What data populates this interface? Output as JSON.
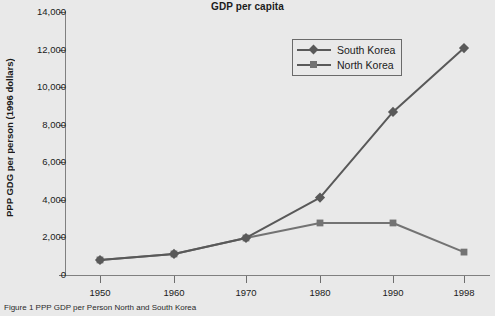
{
  "chart_data": {
    "type": "line",
    "title": "GDP per capita",
    "xlabel": "",
    "ylabel": "PPP GDG per person (1996 dollars)",
    "x": [
      "1950",
      "1960",
      "1970",
      "1980",
      "1990",
      "1998"
    ],
    "xtick_labels": [
      "1950",
      "1960",
      "1970",
      "1980",
      "1990",
      "1998"
    ],
    "ytick_labels": [
      "0",
      "2,000",
      "4,000",
      "6,000",
      "8,000",
      "10,000",
      "12,000",
      "14,000"
    ],
    "ytick_values": [
      0,
      2000,
      4000,
      6000,
      8000,
      10000,
      12000,
      14000
    ],
    "ylim": [
      0,
      14000
    ],
    "grid": false,
    "legend_position": "top-right",
    "series": [
      {
        "name": "South Korea",
        "marker": "diamond",
        "color": "#595959",
        "values": [
          800,
          1120,
          1970,
          4120,
          8680,
          12080
        ]
      },
      {
        "name": "North Korea",
        "marker": "square",
        "color": "#737373",
        "values": [
          800,
          1120,
          1970,
          2770,
          2770,
          1220
        ]
      }
    ]
  },
  "caption": {
    "text": "Figure 1   PPP GDP per Person North and South Korea"
  },
  "colors": {
    "background": "#e9e9e9",
    "axis": "#808080",
    "text": "#1b1b1b",
    "south_korea": "#595959",
    "north_korea": "#737373"
  }
}
